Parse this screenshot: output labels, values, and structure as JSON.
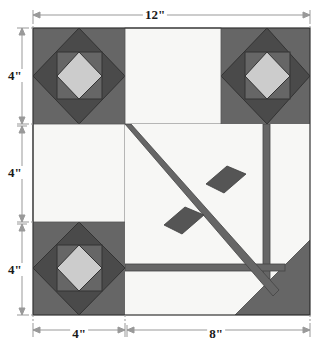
{
  "diagram": {
    "type": "quilt-block-schematic",
    "block_size_inches": 12,
    "colors": {
      "background": "#ffffff",
      "white_patch": "#f7f7f5",
      "medium_gray": "#666666",
      "dark_gray": "#4a4a4a",
      "light_gray": "#cccccc",
      "outline": "#333333",
      "dimension_line": "#999999",
      "label_text": "#1a1a1a"
    },
    "geometry": {
      "block_left": 33,
      "block_top": 28,
      "block_right": 310,
      "block_bottom": 315,
      "grid_x": 125,
      "grid_y_top": 124,
      "grid_y_bottom": 222,
      "grid_x_right": 221,
      "corner_vertex_x": 267,
      "strip_y_horizontal": 267
    }
  },
  "dimensions": {
    "top": {
      "label": "12\"",
      "inches": 12,
      "orientation": "horizontal"
    },
    "bottom_left": {
      "label": "4\"",
      "inches": 4,
      "orientation": "horizontal"
    },
    "bottom_right": {
      "label": "8\"",
      "inches": 8,
      "orientation": "horizontal"
    },
    "left_top": {
      "label": "4\"",
      "inches": 4,
      "orientation": "vertical"
    },
    "left_middle": {
      "label": "4\"",
      "inches": 4,
      "orientation": "vertical"
    },
    "left_bottom": {
      "label": "4\"",
      "inches": 4,
      "orientation": "vertical"
    }
  },
  "patches": {
    "corner_blocks": [
      {
        "name": "top-left-corner-block",
        "position": "top-left",
        "layers": [
          "medium-gray-square",
          "dark-gray-diamond",
          "medium-gray-square",
          "light-gray-diamond"
        ]
      },
      {
        "name": "top-right-corner-block",
        "position": "top-right",
        "layers": [
          "medium-gray-square",
          "dark-gray-diamond",
          "medium-gray-square",
          "light-gray-diamond"
        ]
      },
      {
        "name": "bottom-left-corner-block",
        "position": "bottom-left",
        "layers": [
          "medium-gray-square",
          "dark-gray-diamond",
          "medium-gray-square",
          "light-gray-diamond"
        ]
      }
    ],
    "white_patches": [
      {
        "name": "top-center-white-square",
        "position": "top-center"
      },
      {
        "name": "middle-left-white-square",
        "position": "middle-left"
      },
      {
        "name": "center-white-field",
        "position": "center-right"
      }
    ],
    "strips": [
      {
        "name": "diagonal-strip",
        "direction": "top-left-to-bottom-right"
      },
      {
        "name": "vertical-strip",
        "direction": "vertical-right"
      },
      {
        "name": "horizontal-strip",
        "direction": "horizontal-lower"
      }
    ],
    "diamonds": [
      {
        "name": "upper-right-diamond",
        "shape": "parallelogram"
      },
      {
        "name": "lower-left-diamond",
        "shape": "parallelogram"
      }
    ],
    "triangles": [
      {
        "name": "bottom-right-triangle",
        "shape": "right-triangle",
        "color": "dark-gray"
      }
    ]
  }
}
